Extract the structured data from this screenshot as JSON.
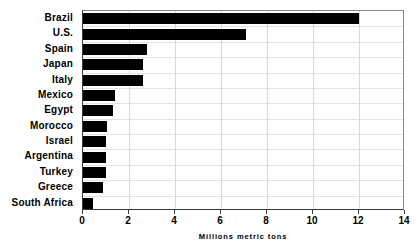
{
  "chart_data": {
    "type": "bar",
    "orientation": "horizontal",
    "title": "",
    "xlabel": "Millions metric tons",
    "ylabel": "",
    "xlim": [
      0,
      14
    ],
    "xticks": [
      0,
      2,
      4,
      6,
      8,
      10,
      12,
      14
    ],
    "xtick_labels": [
      "0",
      "2",
      "4",
      "6",
      "8",
      "10",
      "12",
      "14"
    ],
    "grid": true,
    "legend": false,
    "categories": [
      "Brazil",
      "U.S.",
      "Spain",
      "Japan",
      "Italy",
      "Mexico",
      "Egypt",
      "Morocco",
      "Israel",
      "Argentina",
      "Turkey",
      "Greece",
      "South Africa"
    ],
    "values": [
      12.0,
      7.1,
      2.8,
      2.6,
      2.6,
      1.4,
      1.3,
      1.05,
      1.0,
      1.0,
      1.0,
      0.85,
      0.45
    ],
    "bar_color": "#000000"
  }
}
